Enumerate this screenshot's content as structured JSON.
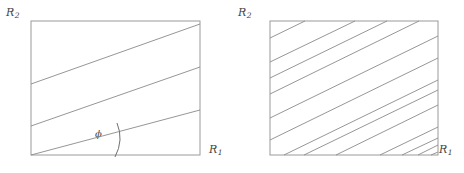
{
  "figure": {
    "width": 464,
    "height": 173,
    "background": "#ffffff",
    "stroke_color": "#8a8a8a",
    "border_color": "#9a9a9a",
    "text_color": "#444444"
  },
  "panels": [
    {
      "id": "left",
      "name": "panel-left",
      "axis_x_label": "R",
      "axis_x_sub": "1",
      "axis_y_label": "R",
      "axis_y_sub": "2",
      "angle_label": "ϕ",
      "angle_degrees": 15,
      "rect": {
        "x": 31,
        "y": 21,
        "width": 169,
        "height": 134
      },
      "line_count": 3,
      "lines": [
        {
          "x1": 31,
          "y1": 84,
          "x2": 200,
          "y2": 24
        },
        {
          "x1": 31,
          "y1": 126,
          "x2": 200,
          "y2": 67
        },
        {
          "x1": 31,
          "y1": 155,
          "x2": 200,
          "y2": 110
        }
      ],
      "arc": {
        "cx": 108,
        "cy": 140,
        "radius": 21,
        "start_deg": -24,
        "end_deg": 24
      }
    },
    {
      "id": "right",
      "name": "panel-right",
      "axis_x_label": "R",
      "axis_x_sub": "1",
      "axis_y_label": "R",
      "axis_y_sub": "2",
      "rect": {
        "x": 38,
        "y": 21,
        "width": 168,
        "height": 134
      },
      "line_count": 13,
      "angle_degrees": 36,
      "lines": [
        {
          "x1": 38,
          "y1": 38,
          "x2": 73,
          "y2": 21
        },
        {
          "x1": 38,
          "y1": 62,
          "x2": 123,
          "y2": 21
        },
        {
          "x1": 38,
          "y1": 78,
          "x2": 155,
          "y2": 21
        },
        {
          "x1": 38,
          "y1": 94,
          "x2": 187,
          "y2": 21
        },
        {
          "x1": 38,
          "y1": 118,
          "x2": 206,
          "y2": 36
        },
        {
          "x1": 38,
          "y1": 140,
          "x2": 206,
          "y2": 58
        },
        {
          "x1": 52,
          "y1": 155,
          "x2": 206,
          "y2": 80
        },
        {
          "x1": 72,
          "y1": 155,
          "x2": 206,
          "y2": 90
        },
        {
          "x1": 104,
          "y1": 155,
          "x2": 206,
          "y2": 105
        },
        {
          "x1": 148,
          "y1": 155,
          "x2": 206,
          "y2": 127
        },
        {
          "x1": 170,
          "y1": 155,
          "x2": 206,
          "y2": 138
        },
        {
          "x1": 186,
          "y1": 155,
          "x2": 206,
          "y2": 145
        },
        {
          "x1": 199,
          "y1": 155,
          "x2": 206,
          "y2": 152
        }
      ]
    }
  ]
}
